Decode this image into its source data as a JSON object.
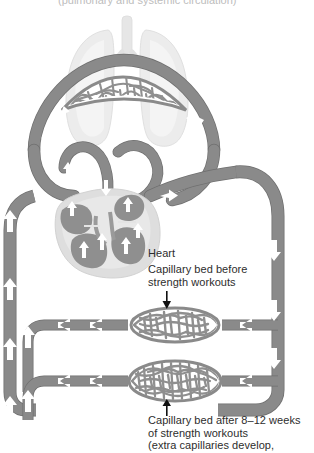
{
  "figure": {
    "title_clipped": "(pulmonary and systemic circulation)",
    "type": "anatomical-diagram",
    "colors": {
      "background": "#ffffff",
      "vessel": "#8a8a8a",
      "vessel_edge": "#6f6f6f",
      "capillary_mesh": "#8f8f8f",
      "lung_fill": "#ececec",
      "lung_edge": "#dcdcdc",
      "heart_body": "#d8d8d8",
      "heart_chamber": "#8f8f8f",
      "arrow": "#ffffff",
      "text": "#2d2d2d",
      "pointer": "#111111"
    }
  },
  "labels": {
    "heart": "Heart",
    "capillary_before": "Capillary bed before\nstrength workouts",
    "capillary_after": "Capillary bed after 8–12 weeks\nof strength workouts\n(extra capillaries develop,"
  },
  "structures": [
    {
      "name": "lungs",
      "label": "Lungs",
      "visible_label": false
    },
    {
      "name": "pulmonary-capillary-bed",
      "label": "Pulmonary capillary bed",
      "visible_label": false
    },
    {
      "name": "heart",
      "label": "Heart",
      "visible_label": true
    },
    {
      "name": "capillary-bed-before",
      "label": "Capillary bed before strength workouts",
      "visible_label": true,
      "density": "sparse"
    },
    {
      "name": "capillary-bed-after",
      "label": "Capillary bed after 8-12 weeks of strength workouts",
      "visible_label": true,
      "density": "dense"
    }
  ],
  "flow_arrows": {
    "left_vertical": "up",
    "right_vertical": "down",
    "horizontal_upper": "left",
    "horizontal_lower": "left",
    "description": "White arrows indicate direction of blood flow"
  }
}
